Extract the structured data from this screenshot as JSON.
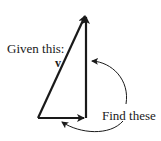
{
  "labels": {
    "given": "Given this:",
    "vector": "v",
    "find": "Find these"
  },
  "colors": {
    "stroke": "#1a1a1a",
    "background": "#ffffff"
  }
}
